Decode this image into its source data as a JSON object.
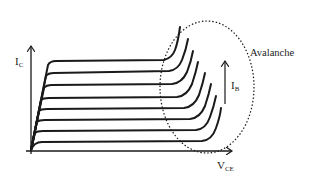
{
  "diagram": {
    "y_axis": {
      "label": "I",
      "subscript": "C"
    },
    "x_axis": {
      "label": "V",
      "subscript": "CE"
    },
    "ib_arrow": {
      "label": "I",
      "subscript": "B"
    },
    "annotation": "Avalanche",
    "curve_count": 8,
    "colors": {
      "stroke": "#1a1a1a",
      "background": "#ffffff"
    }
  }
}
